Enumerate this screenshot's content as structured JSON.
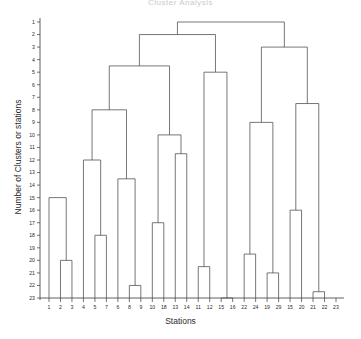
{
  "chart_data": {
    "type": "dendrogram",
    "title": "Cluster Analysis",
    "xlabel": "Stations",
    "ylabel": "Number of Clusters or stations",
    "ylim": [
      1,
      23
    ],
    "y_ticks": [
      1,
      2,
      3,
      4,
      5,
      6,
      7,
      8,
      9,
      10,
      11,
      12,
      13,
      14,
      15,
      16,
      17,
      18,
      19,
      20,
      21,
      22,
      23
    ],
    "grid": false,
    "legend": null,
    "leaf_labels": [
      "1",
      "2",
      "3",
      "4",
      "5",
      "7",
      "6",
      "8",
      "9",
      "10",
      "18",
      "13",
      "14",
      "11",
      "12",
      "15",
      "16",
      "22",
      "24",
      "19",
      "29",
      "15",
      "20",
      "21",
      "22",
      "23"
    ],
    "leaves": [
      {
        "label": "1",
        "x": 1
      },
      {
        "label": "2",
        "x": 2
      },
      {
        "label": "3",
        "x": 3
      },
      {
        "label": "4",
        "x": 4
      },
      {
        "label": "5",
        "x": 5
      },
      {
        "label": "7",
        "x": 6
      },
      {
        "label": "6",
        "x": 7
      },
      {
        "label": "8",
        "x": 8
      },
      {
        "label": "9",
        "x": 9
      },
      {
        "label": "10",
        "x": 10
      },
      {
        "label": "18",
        "x": 11
      },
      {
        "label": "13",
        "x": 12
      },
      {
        "label": "14",
        "x": 13
      },
      {
        "label": "11",
        "x": 14
      },
      {
        "label": "12",
        "x": 15
      },
      {
        "label": "15",
        "x": 16
      },
      {
        "label": "16",
        "x": 17
      },
      {
        "label": "22",
        "x": 18
      },
      {
        "label": "24",
        "x": 19
      },
      {
        "label": "19",
        "x": 20
      },
      {
        "label": "29",
        "x": 21
      },
      {
        "label": "15",
        "x": 22
      },
      {
        "label": "20",
        "x": 23
      },
      {
        "label": "21",
        "x": 24
      },
      {
        "label": "22",
        "x": 25
      },
      {
        "label": "23",
        "x": 26
      }
    ],
    "merges": [
      {
        "id": "m1",
        "left": {
          "leaf": 2
        },
        "right": {
          "leaf": 3
        },
        "height": 20.0
      },
      {
        "id": "m2",
        "left": {
          "leaf": 1
        },
        "right": {
          "node": "m1"
        },
        "height": 15.0
      },
      {
        "id": "m3",
        "left": {
          "leaf": 5
        },
        "right": {
          "leaf": 6
        },
        "height": 18.0
      },
      {
        "id": "m4",
        "left": {
          "leaf": 4
        },
        "right": {
          "node": "m3"
        },
        "height": 12.0
      },
      {
        "id": "m5",
        "left": {
          "leaf": 8
        },
        "right": {
          "leaf": 9
        },
        "height": 22.0
      },
      {
        "id": "m6",
        "left": {
          "leaf": 7
        },
        "right": {
          "node": "m5"
        },
        "height": 13.5
      },
      {
        "id": "m7",
        "left": {
          "node": "m4"
        },
        "right": {
          "node": "m6"
        },
        "height": 8.0
      },
      {
        "id": "m8",
        "left": {
          "leaf": 10
        },
        "right": {
          "leaf": 11
        },
        "height": 17.0
      },
      {
        "id": "m9",
        "left": {
          "leaf": 12
        },
        "right": {
          "leaf": 13
        },
        "height": 11.5
      },
      {
        "id": "m10",
        "left": {
          "node": "m8"
        },
        "right": {
          "node": "m9"
        },
        "height": 10.0
      },
      {
        "id": "m11",
        "left": {
          "node": "m7"
        },
        "right": {
          "node": "m10"
        },
        "height": 4.5
      },
      {
        "id": "m12",
        "left": {
          "leaf": 14
        },
        "right": {
          "leaf": 15
        },
        "height": 20.5
      },
      {
        "id": "m13",
        "left": {
          "leaf": 16
        },
        "right": {
          "leaf": 17
        },
        "height": 23.0
      },
      {
        "id": "m14",
        "left": {
          "node": "m12"
        },
        "right": {
          "node": "m13"
        },
        "height": 5.0
      },
      {
        "id": "m15",
        "left": {
          "node": "m11"
        },
        "right": {
          "node": "m14"
        },
        "height": 2.0
      },
      {
        "id": "m16",
        "left": {
          "leaf": 18
        },
        "right": {
          "leaf": 19
        },
        "height": 19.5
      },
      {
        "id": "m17",
        "left": {
          "leaf": 20
        },
        "right": {
          "leaf": 21
        },
        "height": 21.0
      },
      {
        "id": "m18",
        "left": {
          "node": "m16"
        },
        "right": {
          "node": "m17"
        },
        "height": 9.0
      },
      {
        "id": "m19",
        "left": {
          "leaf": 22
        },
        "right": {
          "leaf": 23
        },
        "height": 16.0
      },
      {
        "id": "m20",
        "left": {
          "leaf": 24
        },
        "right": {
          "leaf": 25
        },
        "height": 22.5
      },
      {
        "id": "m21",
        "left": {
          "node": "m19"
        },
        "right": {
          "node": "m20"
        },
        "height": 7.5
      },
      {
        "id": "m22",
        "left": {
          "node": "m18"
        },
        "right": {
          "node": "m21"
        },
        "height": 3.0
      },
      {
        "id": "m23",
        "left": {
          "node": "m15"
        },
        "right": {
          "node": "m22"
        },
        "height": 1.0
      }
    ]
  }
}
